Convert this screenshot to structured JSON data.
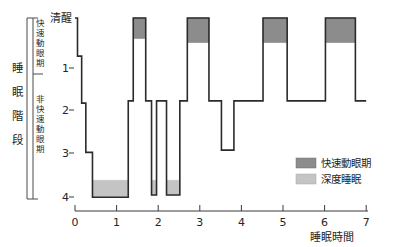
{
  "chart_data": {
    "type": "line",
    "title": "",
    "xlabel": "睡眠時間",
    "ylabel": "睡眠階段",
    "xlim": [
      0,
      7
    ],
    "ylim_categories": [
      "清醒",
      "1",
      "2",
      "3",
      "4"
    ],
    "xticks": [
      "0",
      "1",
      "2",
      "3",
      "4",
      "5",
      "6",
      "7"
    ],
    "yticks": [
      "清醒",
      "1",
      "2",
      "3",
      "4"
    ],
    "grid": false,
    "legend_position": "right-lower",
    "series": [
      {
        "name": "睡眠階段曲線",
        "points": [
          {
            "t": 0.0,
            "stage": 0.0
          },
          {
            "t": 0.06,
            "stage": 0.0
          },
          {
            "t": 0.06,
            "stage": 0.85
          },
          {
            "t": 0.16,
            "stage": 0.85
          },
          {
            "t": 0.16,
            "stage": 1.9
          },
          {
            "t": 0.26,
            "stage": 1.9
          },
          {
            "t": 0.26,
            "stage": 3.0
          },
          {
            "t": 0.42,
            "stage": 3.0
          },
          {
            "t": 0.42,
            "stage": 4.0
          },
          {
            "t": 1.28,
            "stage": 4.0
          },
          {
            "t": 1.28,
            "stage": 1.85
          },
          {
            "t": 1.4,
            "stage": 1.85
          },
          {
            "t": 1.4,
            "stage": 0.0
          },
          {
            "t": 1.7,
            "stage": 0.0
          },
          {
            "t": 1.7,
            "stage": 1.85
          },
          {
            "t": 1.84,
            "stage": 1.85
          },
          {
            "t": 1.84,
            "stage": 3.95
          },
          {
            "t": 1.96,
            "stage": 3.95
          },
          {
            "t": 1.96,
            "stage": 1.85
          },
          {
            "t": 2.2,
            "stage": 1.85
          },
          {
            "t": 2.2,
            "stage": 3.95
          },
          {
            "t": 2.52,
            "stage": 3.95
          },
          {
            "t": 2.52,
            "stage": 1.85
          },
          {
            "t": 2.7,
            "stage": 1.85
          },
          {
            "t": 2.7,
            "stage": 0.0
          },
          {
            "t": 3.22,
            "stage": 0.0
          },
          {
            "t": 3.22,
            "stage": 1.85
          },
          {
            "t": 3.52,
            "stage": 1.85
          },
          {
            "t": 3.52,
            "stage": 2.95
          },
          {
            "t": 3.82,
            "stage": 2.95
          },
          {
            "t": 3.82,
            "stage": 1.85
          },
          {
            "t": 4.52,
            "stage": 1.85
          },
          {
            "t": 4.52,
            "stage": 0.0
          },
          {
            "t": 5.1,
            "stage": 0.0
          },
          {
            "t": 5.1,
            "stage": 1.85
          },
          {
            "t": 6.02,
            "stage": 1.85
          },
          {
            "t": 6.02,
            "stage": 0.0
          },
          {
            "t": 6.74,
            "stage": 0.0
          },
          {
            "t": 6.74,
            "stage": 1.85
          },
          {
            "t": 7.0,
            "stage": 1.85
          }
        ]
      }
    ],
    "rem_blocks": [
      {
        "t_start": 1.4,
        "t_end": 1.7,
        "stage_top": 0.0,
        "stage_bottom": 0.46
      },
      {
        "t_start": 2.7,
        "t_end": 3.22,
        "stage_top": 0.0,
        "stage_bottom": 0.55
      },
      {
        "t_start": 4.52,
        "t_end": 5.1,
        "stage_top": 0.0,
        "stage_bottom": 0.55
      },
      {
        "t_start": 6.02,
        "t_end": 6.74,
        "stage_top": 0.0,
        "stage_bottom": 0.55
      }
    ],
    "deep_sleep_blocks": [
      {
        "t_start": 0.42,
        "t_end": 1.28,
        "stage_top": 3.62,
        "stage_bottom": 4.0
      },
      {
        "t_start": 1.84,
        "t_end": 1.96,
        "stage_top": 3.62,
        "stage_bottom": 3.95
      },
      {
        "t_start": 2.2,
        "t_end": 2.52,
        "stage_top": 3.62,
        "stage_bottom": 3.95
      }
    ]
  },
  "axes": {
    "y_axis_title": "睡眠階段",
    "x_axis_title": "睡眠時間",
    "bracket_rem_label": "快速動眼期",
    "bracket_nrem_label": "非快速動眼期",
    "y_labels": {
      "awake": "清醒",
      "s1": "1",
      "s2": "2",
      "s3": "3",
      "s4": "4"
    },
    "x_labels": [
      "0",
      "1",
      "2",
      "3",
      "4",
      "5",
      "6",
      "7"
    ]
  },
  "legend": {
    "items": [
      {
        "label": "快速動眼期",
        "color": "#8c8c8c"
      },
      {
        "label": "深度睡眠",
        "color": "#c4c4c4"
      }
    ]
  },
  "colors": {
    "rem_fill": "#8c8c8c",
    "deep_fill": "#c4c4c4",
    "trace_stroke": "#2b2b2b",
    "axis": "#3a3a3a",
    "text": "#262626",
    "background": "#ffffff"
  }
}
